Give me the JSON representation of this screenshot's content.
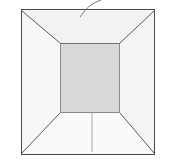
{
  "figure": {
    "kind": "line-drawing",
    "background_color": "#ffffff"
  },
  "colors": {
    "background": "#ffffff",
    "outline": "#4a4a4a",
    "dashed_guide": "#6e6e6e",
    "fold_line": "#5a5a5a",
    "wall_fill": "#f6f6f6",
    "floor_fill": "#d9d9d9",
    "floor_stroke": "#8a8a8a",
    "leader_line": "#6a6a6a",
    "seam_line": "#a8a8a8"
  },
  "geometry": {
    "outer_rect": {
      "x": 21,
      "y": 9,
      "width": 134,
      "height": 146
    },
    "dashed_rect": {
      "x": 25,
      "y": 13,
      "width": 126,
      "height": 138
    },
    "floor_rect": {
      "x": 60,
      "y": 43,
      "width": 60,
      "height": 70
    },
    "diagonals": [
      {
        "name": "top-left-fold",
        "x1": 22,
        "y1": 11,
        "x2": 60,
        "y2": 43
      },
      {
        "name": "top-right-fold",
        "x1": 154,
        "y1": 11,
        "x2": 120,
        "y2": 43
      },
      {
        "name": "bottom-left-fold",
        "x1": 22,
        "y1": 153,
        "x2": 60,
        "y2": 113
      },
      {
        "name": "bottom-right-fold",
        "x1": 154,
        "y1": 153,
        "x2": 120,
        "y2": 113
      }
    ],
    "seam": {
      "name": "bottom-center-seam",
      "x1": 92,
      "y1": 113,
      "x2": 92,
      "y2": 152
    },
    "leader": {
      "name": "top-leader-curve",
      "start": {
        "x": 80,
        "y": 17
      },
      "control": {
        "x": 88,
        "y": 4
      },
      "end": {
        "x": 101,
        "y": 0
      }
    }
  },
  "labels": {
    "figure_caption": "",
    "reference_numerals": []
  }
}
